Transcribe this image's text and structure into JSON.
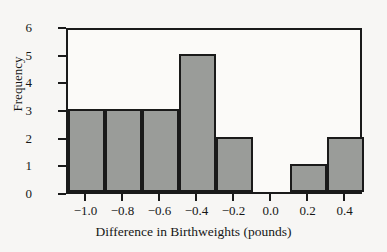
{
  "chart_data": {
    "type": "bar",
    "title": "",
    "xlabel": "Difference in Birthweights (pounds)",
    "ylabel": "Frequency",
    "categories": [
      "-1.0",
      "-0.8",
      "-0.6",
      "-0.4",
      "-0.2",
      "0.0",
      "0.2",
      "0.4"
    ],
    "values": [
      3,
      3,
      3,
      5,
      2,
      0,
      1,
      2
    ],
    "bin_centers": [
      -1.0,
      -0.8,
      -0.6,
      -0.4,
      -0.2,
      0.0,
      0.2,
      0.4
    ],
    "bin_width": 0.2,
    "bin_edges": [
      -1.1,
      -0.9,
      -0.7,
      -0.5,
      -0.3,
      -0.1,
      0.1,
      0.3,
      0.5
    ],
    "xlim": [
      -1.1,
      0.5
    ],
    "ylim": [
      0,
      6
    ],
    "xticks": [
      -1.0,
      -0.8,
      -0.6,
      -0.4,
      -0.2,
      0.0,
      0.2,
      0.4
    ],
    "xtick_labels": [
      "−1.0",
      "−0.8",
      "−0.6",
      "−0.4",
      "−0.2",
      "0.0",
      "0.2",
      "0.4"
    ],
    "yticks": [
      0,
      1,
      2,
      3,
      4,
      5,
      6
    ],
    "ytick_labels": [
      "0",
      "1",
      "2",
      "3",
      "4",
      "5",
      "6"
    ],
    "grid": false,
    "legend": null,
    "bar_fill_color": "#9a9c99",
    "bar_edge_color": "#1a1a1a",
    "background_color": "#f7f6f4",
    "plot_background_color": "#fbfaf8",
    "axis_color": "#1a1a1a"
  }
}
